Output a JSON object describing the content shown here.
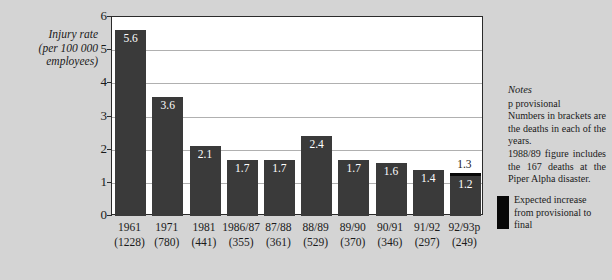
{
  "chart_data": {
    "type": "bar",
    "title": "",
    "ylabel_lines": [
      "Injury rate",
      "(per 100 000",
      "employees)"
    ],
    "xlabel": "",
    "ylim": [
      0,
      6
    ],
    "yticks": [
      "0",
      "1",
      "2",
      "3",
      "4",
      "5",
      "6"
    ],
    "grid": true,
    "legend_position": "right",
    "categories": [
      "1961",
      "1971",
      "1981",
      "1986/87",
      "87/88",
      "88/89",
      "89/90",
      "90/91",
      "91/92",
      "92/93p"
    ],
    "deaths": [
      "(1228)",
      "(780)",
      "(441)",
      "(355)",
      "(361)",
      "(529)",
      "(370)",
      "(346)",
      "(297)",
      "(249)"
    ],
    "values": [
      5.6,
      3.6,
      2.1,
      1.7,
      1.7,
      2.4,
      1.7,
      1.6,
      1.4,
      1.2
    ],
    "value_labels": [
      "5.6",
      "3.6",
      "2.1",
      "1.7",
      "1.7",
      "2.4",
      "1.7",
      "1.6",
      "1.4",
      "1.2"
    ],
    "expected_final": {
      "category": "92/93p",
      "provisional": 1.2,
      "final": 1.3,
      "final_label": "1.3"
    },
    "bar_color": "#3a3a3a",
    "cap_color": "#080808",
    "plot_background": "#ffffff",
    "page_background": "#d4d4d4"
  },
  "notes": {
    "title": "Notes",
    "lines": [
      "p   provisional",
      "Numbers in brackets are the deaths in each of the years.",
      "1988/89 figure includes the 167 deaths at the Piper Alpha disaster."
    ]
  },
  "legend": {
    "swatch_name": "expected-increase-swatch",
    "label": "Expected increase from provisional to final"
  }
}
